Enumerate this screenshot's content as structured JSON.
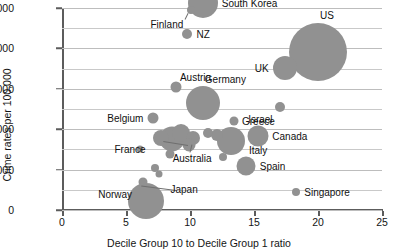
{
  "chart_data": {
    "type": "scatter",
    "title": "",
    "xlabel": "Decile Group 10 to Decile Group 1 ratio",
    "ylabel": "Crime rates per 100,000",
    "xlim": [
      0,
      25
    ],
    "ylim": [
      0,
      5000
    ],
    "xticks": [
      0,
      5,
      10,
      15,
      20,
      25
    ],
    "xtick_labels": [
      "0",
      "5",
      "10",
      "15",
      "20",
      "25"
    ],
    "yticks": [
      0,
      1000,
      2000,
      3000,
      4000,
      5000
    ],
    "ytick_labels": [
      "0",
      "1,000",
      "2,000",
      "3,000",
      "4,000",
      "5,000"
    ],
    "gridlines_y": [
      0,
      500,
      1000,
      1500,
      2000,
      2500,
      3000,
      3500,
      4000,
      4500,
      5000
    ],
    "grid": true,
    "legend": "none",
    "bubble_color": "#919191",
    "note": "Bubble area encodes a third variable (relative magnitude); sizes read off the plot.",
    "points": [
      {
        "name": "South Korea",
        "x": 11.0,
        "y": 5120,
        "size": 30,
        "label_pos": "right"
      },
      {
        "name": "Finland",
        "x": 10.1,
        "y": 4960,
        "size": 8,
        "label_pos": "left",
        "leader": true
      },
      {
        "name": "NZ",
        "x": 9.8,
        "y": 4350,
        "size": 10,
        "label_pos": "right"
      },
      {
        "name": "US",
        "x": 20.0,
        "y": 3900,
        "size": 58,
        "label_pos": "right"
      },
      {
        "name": "UK",
        "x": 17.4,
        "y": 3510,
        "size": 24,
        "label_pos": "left"
      },
      {
        "name": "Austria",
        "x": 8.9,
        "y": 3040,
        "size": 11,
        "label_pos": "right"
      },
      {
        "name": "Germany",
        "x": 11.0,
        "y": 2650,
        "size": 34,
        "label_pos": "right"
      },
      {
        "name": "Israel",
        "x": 17.0,
        "y": 2560,
        "size": 10,
        "label_pos": "right"
      },
      {
        "name": "Belgium",
        "x": 7.1,
        "y": 2270,
        "size": 11,
        "label_pos": "left"
      },
      {
        "name": "Greece",
        "x": 13.4,
        "y": 2200,
        "size": 9,
        "label_pos": "right"
      },
      {
        "name": "Canada",
        "x": 15.3,
        "y": 1840,
        "size": 21,
        "label_pos": "right"
      },
      {
        "name": "Italy",
        "x": 13.2,
        "y": 1700,
        "size": 28,
        "label_pos": "right"
      },
      {
        "name": "France",
        "x": 8.6,
        "y": 1760,
        "size": 25,
        "label_pos": "left",
        "leader": true
      },
      {
        "name": "Australia",
        "x": 10.2,
        "y": 1790,
        "size": 14,
        "label_pos": "left",
        "leader": true
      },
      {
        "name": "Spain",
        "x": 14.4,
        "y": 1090,
        "size": 19,
        "label_pos": "right"
      },
      {
        "name": "Norway",
        "x": 6.3,
        "y": 700,
        "size": 9,
        "label_pos": "left",
        "leader": true
      },
      {
        "name": "Singapore",
        "x": 18.3,
        "y": 450,
        "size": 8,
        "label_pos": "right"
      },
      {
        "name": "Japan",
        "x": 6.6,
        "y": 230,
        "size": 36,
        "label_pos": "right"
      },
      {
        "name": "",
        "x": 7.7,
        "y": 1780,
        "size": 16,
        "label_pos": "none"
      },
      {
        "name": "",
        "x": 9.3,
        "y": 1900,
        "size": 18,
        "label_pos": "none"
      },
      {
        "name": "",
        "x": 9.9,
        "y": 1610,
        "size": 13,
        "label_pos": "none"
      },
      {
        "name": "",
        "x": 11.4,
        "y": 1900,
        "size": 10,
        "label_pos": "none"
      },
      {
        "name": "",
        "x": 12.1,
        "y": 1850,
        "size": 12,
        "label_pos": "none"
      },
      {
        "name": "",
        "x": 8.4,
        "y": 1380,
        "size": 9,
        "label_pos": "none"
      },
      {
        "name": "",
        "x": 7.3,
        "y": 1050,
        "size": 8,
        "label_pos": "none"
      },
      {
        "name": "",
        "x": 7.6,
        "y": 880,
        "size": 7,
        "label_pos": "none"
      },
      {
        "name": "",
        "x": 12.6,
        "y": 1300,
        "size": 8,
        "label_pos": "none"
      },
      {
        "name": "",
        "x": 6.1,
        "y": 1510,
        "size": 7,
        "label_pos": "none"
      }
    ]
  }
}
